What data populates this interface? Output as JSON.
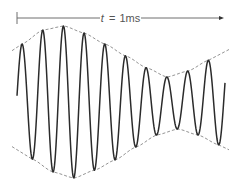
{
  "diagram": {
    "type": "amplitude-modulated-waveform",
    "duration_label": {
      "variable": "t",
      "equals": "=",
      "value": "1ms"
    },
    "colors": {
      "wave": "#2b2b2b",
      "envelope": "#888888",
      "arrow": "#6e6e6e",
      "text": "#555555"
    },
    "wave": {
      "x_start": 17,
      "x_end": 225,
      "center_y": 102,
      "period_px": 20.7,
      "cycles": 10,
      "peaks": [
        {
          "x": 22,
          "y": 44
        },
        {
          "x": 43,
          "y": 30
        },
        {
          "x": 64,
          "y": 26
        },
        {
          "x": 84,
          "y": 33
        },
        {
          "x": 105,
          "y": 44
        },
        {
          "x": 126,
          "y": 56
        },
        {
          "x": 147,
          "y": 68
        },
        {
          "x": 167,
          "y": 77
        },
        {
          "x": 188,
          "y": 71
        },
        {
          "x": 209,
          "y": 60
        }
      ],
      "troughs": [
        {
          "x": 32,
          "y": 159
        },
        {
          "x": 53,
          "y": 172
        },
        {
          "x": 74,
          "y": 178
        },
        {
          "x": 95,
          "y": 170
        },
        {
          "x": 115,
          "y": 160
        },
        {
          "x": 136,
          "y": 147
        },
        {
          "x": 157,
          "y": 135
        },
        {
          "x": 178,
          "y": 129
        },
        {
          "x": 198,
          "y": 135
        },
        {
          "x": 219,
          "y": 145
        }
      ]
    }
  }
}
